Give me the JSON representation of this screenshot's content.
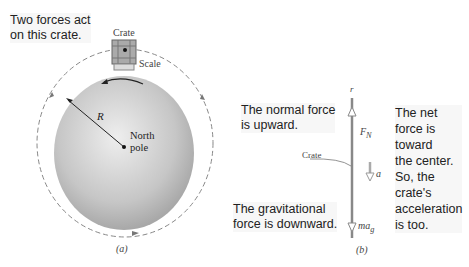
{
  "panel_a": {
    "caption_note": [
      "Two forces act",
      "on this crate."
    ],
    "crate_label": "Crate",
    "scale_label": "Scale",
    "radius_label": "R",
    "north_pole_label": [
      "North",
      "pole"
    ],
    "panel_label": "(a)"
  },
  "panel_b": {
    "normal_note": [
      "The normal force",
      "is upward."
    ],
    "grav_note": [
      "The gravitational",
      "force is downward."
    ],
    "net_note": [
      "The net",
      "force is",
      "toward",
      "the center.",
      "So, the",
      "crate's",
      "acceleration",
      "is too."
    ],
    "axis_label": "r",
    "crate_label": "Crate",
    "fn_label": "F",
    "fn_sub": "N",
    "a_label": "a",
    "mg_label": "ma",
    "mg_sub": "g",
    "panel_label": "(b)"
  },
  "colors": {
    "earth": "#c8c8c8",
    "dashed": "#777777",
    "axis": "#888888"
  }
}
